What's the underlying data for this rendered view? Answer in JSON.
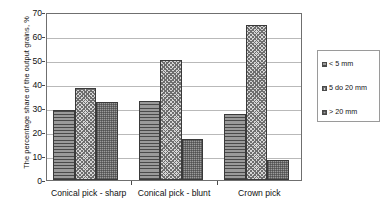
{
  "chart_data": {
    "type": "bar",
    "title": "",
    "xlabel": "",
    "ylabel": "The percentage share of the output grains, %",
    "ylim": [
      0,
      70
    ],
    "ytick_step": 10,
    "yticks": [
      0,
      10,
      20,
      30,
      40,
      50,
      60,
      70
    ],
    "grid": true,
    "legend_position": "right",
    "categories": [
      "Conical pick - sharp",
      "Conical pick - blunt",
      "Crown pick"
    ],
    "series": [
      {
        "name": "< 5 mm",
        "values": [
          29.0,
          33.0,
          27.5
        ]
      },
      {
        "name": "5 do 20 mm",
        "values": [
          38.5,
          50.0,
          64.5
        ]
      },
      {
        "name": "> 20 mm",
        "values": [
          32.5,
          17.0,
          8.3
        ]
      }
    ]
  },
  "axes": {
    "y_title": "The percentage share of the output grains, %",
    "y_tick_labels": [
      "70",
      "60",
      "50",
      "40",
      "30",
      "20",
      "10",
      "0"
    ],
    "x_tick_labels": [
      "Conical pick - sharp",
      "Conical pick - blunt",
      "Crown pick"
    ]
  },
  "legend": {
    "items": [
      {
        "label": "< 5 mm",
        "swatch": "series-1-swatch-icon"
      },
      {
        "label": "5 do 20 mm",
        "swatch": "series-2-swatch-icon"
      },
      {
        "label": "> 20 mm",
        "swatch": "series-3-swatch-icon"
      }
    ]
  },
  "colors": {
    "series_1": "#8e8e8e",
    "series_2": "#d6d6d6",
    "series_3": "#9b9b9b",
    "gridline": "#b9b9b9",
    "axis": "#6f6f6f",
    "text": "#111111"
  }
}
